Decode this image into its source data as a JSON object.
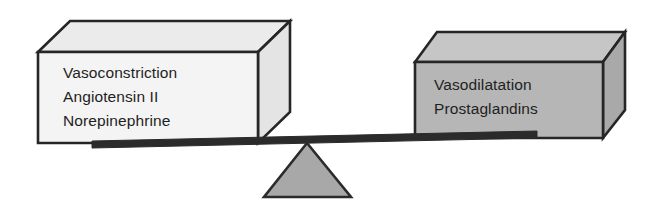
{
  "diagram": {
    "type": "balance-scale",
    "background_color": "#ffffff",
    "outline_color": "#262626",
    "left_block": {
      "name": "vasoconstriction-block",
      "fill_color": "#f2f2f2",
      "top_face_color": "#ebebeb",
      "side_face_color": "#e6e6e6",
      "lines": [
        "Vasoconstriction",
        "Angiotensin II",
        "Norepinephrine"
      ]
    },
    "right_block": {
      "name": "vasodilatation-block",
      "fill_color": "#b5b5b5",
      "top_face_color": "#c6c6c6",
      "side_face_color": "#aaaaaa",
      "lines": [
        "Vasodilatation",
        "Prostaglandins"
      ]
    },
    "beam": {
      "name": "balance-beam",
      "color": "#2b2b2b"
    },
    "fulcrum": {
      "name": "fulcrum-triangle",
      "fill_color": "#a8a8a8",
      "outline_color": "#2b2b2b"
    }
  }
}
